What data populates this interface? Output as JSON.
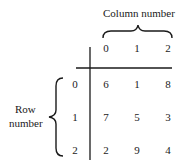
{
  "column_label": "Column number",
  "row_label_line1": "Row",
  "row_label_line2": "number",
  "column_headers": [
    "0",
    "1",
    "2"
  ],
  "row_headers": [
    "0",
    "1",
    "2"
  ],
  "matrix": [
    [
      "6",
      "1",
      "8"
    ],
    [
      "7",
      "5",
      "3"
    ],
    [
      "2",
      "9",
      "4"
    ]
  ]
}
